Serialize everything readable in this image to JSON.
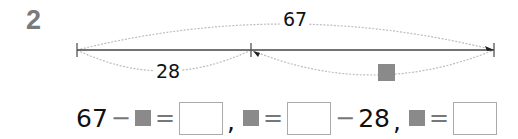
{
  "problem": {
    "number": "2",
    "diagram": {
      "total_label": "67",
      "part_label": "28",
      "unknown_symbol": "gray-square",
      "line_color": "#333333",
      "curve_color": "#bbbbbb",
      "unknown_color": "#8a8a8a"
    },
    "equations": {
      "eq1": {
        "left": "67",
        "minus": "−",
        "equals": "=",
        "comma": ","
      },
      "eq2": {
        "equals": "=",
        "minus": "−",
        "right": "28",
        "comma": ","
      },
      "eq3": {
        "equals": "="
      }
    }
  }
}
